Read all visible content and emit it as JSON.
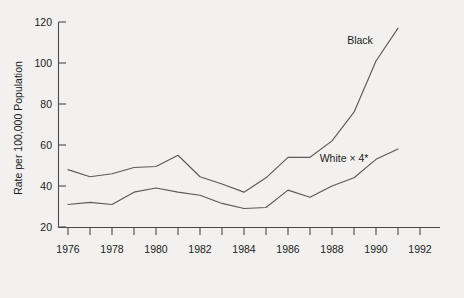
{
  "chart_data": {
    "type": "line",
    "title": "",
    "xlabel": "",
    "ylabel": "Rate per 100,000 Population",
    "xlim": [
      1975.5,
      1992.5
    ],
    "ylim": [
      20,
      120
    ],
    "grid": false,
    "legend_position": "inline-annotation",
    "x_tick_labels": [
      "1976",
      "1978",
      "1980",
      "1982",
      "1984",
      "1986",
      "1988",
      "1990",
      "1992"
    ],
    "x_tick_values": [
      1976,
      1978,
      1980,
      1982,
      1984,
      1986,
      1988,
      1990,
      1992
    ],
    "x_minor_ticks": [
      1977,
      1979,
      1981,
      1983,
      1985,
      1987,
      1989,
      1991
    ],
    "y_tick_labels": [
      "20",
      "40",
      "60",
      "80",
      "100",
      "120"
    ],
    "y_tick_values": [
      20,
      40,
      60,
      80,
      100,
      120
    ],
    "x": [
      1976,
      1977,
      1978,
      1979,
      1980,
      1981,
      1982,
      1983,
      1984,
      1985,
      1986,
      1987,
      1988,
      1989,
      1990,
      1991
    ],
    "series": [
      {
        "name": "Black",
        "label": "Black",
        "color": "#5b5b5b",
        "values": [
          48,
          44.5,
          46,
          49,
          49.5,
          55,
          44.5,
          41,
          37,
          44,
          54,
          54,
          62,
          76,
          101,
          117
        ]
      },
      {
        "name": "White x 4",
        "label": "White × 4*",
        "color": "#5b5b5b",
        "values": [
          31,
          32,
          31,
          37,
          39,
          37,
          35.5,
          31.5,
          29,
          29.5,
          38,
          34.5,
          40,
          44,
          53,
          58
        ]
      }
    ],
    "annotations": [
      {
        "text": "Black",
        "x": 1989.2,
        "y": 110
      },
      {
        "text": "White × 4*",
        "x": 1987.8,
        "y": 63
      }
    ]
  },
  "axis": {
    "y_title": "Rate per 100,000 Population"
  }
}
